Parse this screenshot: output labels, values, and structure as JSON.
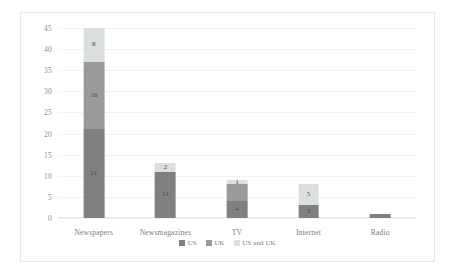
{
  "chart_data": {
    "type": "bar",
    "subtype": "stacked-column",
    "title": "",
    "xlabel": "",
    "ylabel": "",
    "ylim": [
      0,
      45
    ],
    "ytick_step": 5,
    "yticks": [
      "0",
      "5",
      "10",
      "15",
      "20",
      "25",
      "30",
      "35",
      "40",
      "45"
    ],
    "grid": true,
    "legend_position": "bottom-center",
    "categories": [
      "Newspapers",
      "Newsmagazines",
      "TV",
      "Internet",
      "Radio"
    ],
    "series": [
      {
        "name": "US",
        "color": "#808080",
        "values": [
          21,
          11,
          4,
          3,
          1
        ]
      },
      {
        "name": "UK",
        "color": "#9a9a9a",
        "values": [
          16,
          0,
          4,
          0,
          0
        ]
      },
      {
        "name": "US and UK",
        "color": "#dcdfe0",
        "values": [
          8,
          2,
          1,
          5,
          0
        ]
      }
    ],
    "data_labels": [
      {
        "category": "Newspapers",
        "labels": [
          "21",
          "16",
          "8"
        ]
      },
      {
        "category": "Newsmagazines",
        "labels": [
          "11",
          "",
          "2"
        ]
      },
      {
        "category": "TV",
        "labels": [
          "4",
          "",
          "1"
        ]
      },
      {
        "category": "Internet",
        "labels": [
          "3",
          "",
          "5"
        ]
      },
      {
        "category": "Radio",
        "labels": [
          "",
          "",
          ""
        ]
      }
    ],
    "totals": [
      45,
      13,
      9,
      8,
      1
    ]
  },
  "legend": {
    "items": [
      {
        "label": "US"
      },
      {
        "label": "UK"
      },
      {
        "label": "US and UK"
      }
    ]
  },
  "colors": {
    "series_us": "#808080",
    "series_uk": "#9a9a9a",
    "series_us_and_uk": "#dcdfe0",
    "gridline": "#f2f3f4",
    "frame_border": "#e8e8e8",
    "tick_text": "#8d8d8d"
  }
}
